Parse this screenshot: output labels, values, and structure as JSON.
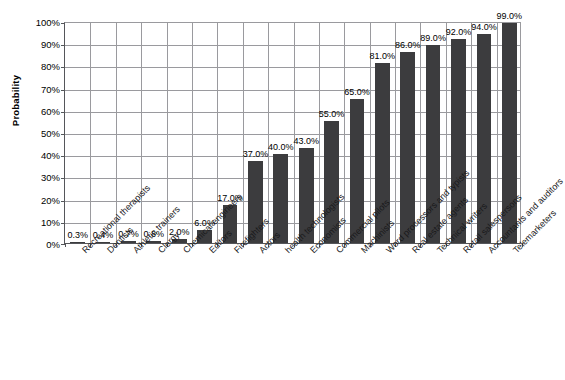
{
  "chart_data": {
    "type": "bar",
    "title": "",
    "xlabel": "",
    "ylabel": "Probability",
    "ylim": [
      0,
      100
    ],
    "ytick_labels": [
      "100%",
      "90%",
      "80%",
      "70%",
      "60%",
      "50%",
      "40%",
      "30%",
      "20%",
      "10%",
      "0%"
    ],
    "ytick_values": [
      100,
      90,
      80,
      70,
      60,
      50,
      40,
      30,
      20,
      10,
      0
    ],
    "grid": true,
    "legend": "none",
    "bar_color": "#3c3c3e",
    "categories": [
      "Recreational therapists",
      "Dentists",
      "Athletic trainers",
      "Clergy",
      "Chemical engineers",
      "Editors",
      "Firefighters",
      "Actors",
      "health technologists",
      "Economists",
      "Commercial pilots",
      "Machinists",
      "Word processors and typists",
      "Real estate agents",
      "Technical writers",
      "Retail salespersons",
      "Accountants and auditors",
      "Telemarketers"
    ],
    "values": [
      0.3,
      0.4,
      0.7,
      0.8,
      2.0,
      6.0,
      17.0,
      37.0,
      40.0,
      43.0,
      55.0,
      65.0,
      81.0,
      86.0,
      89.0,
      92.0,
      94.0,
      99.0
    ],
    "data_labels": [
      "0.3%",
      "0.4%",
      "0.7%",
      "0.8%",
      "2.0%",
      "6.0%",
      "17.0%",
      "37.0%",
      "40.0%",
      "43.0%",
      "55.0%",
      "65.0%",
      "81.0%",
      "86.0%",
      "89.0%",
      "92.0%",
      "94.0%",
      "99.0%"
    ]
  }
}
